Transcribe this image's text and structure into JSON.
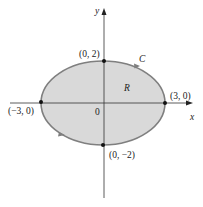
{
  "diagram": {
    "axes": {
      "x_label": "x",
      "y_label": "y",
      "origin_label": "0"
    },
    "ellipse": {
      "curve_label": "C",
      "region_label": "R",
      "fill_color": "#d9d9d9",
      "stroke_color": "#7a7a7a",
      "semi_axis_x": 3,
      "semi_axis_y": 2
    },
    "points": [
      {
        "label": "(0, 2)"
      },
      {
        "label": "(3, 0)"
      },
      {
        "label": "(−3, 0)"
      },
      {
        "label": "(0, −2)"
      }
    ]
  }
}
